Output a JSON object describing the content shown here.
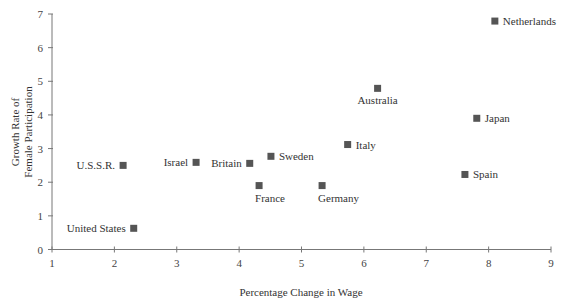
{
  "chart_data": {
    "type": "scatter",
    "title": "",
    "xlabel": "Percentage Change in Wage",
    "ylabel": [
      "Growth Rate of",
      "Female Participation"
    ],
    "xlim": [
      1,
      9
    ],
    "ylim": [
      0,
      7
    ],
    "xticks": [
      1,
      2,
      3,
      4,
      5,
      6,
      7,
      8,
      9
    ],
    "yticks": [
      0,
      1,
      2,
      3,
      4,
      5,
      6,
      7
    ],
    "grid": false,
    "legend": null,
    "marker_color": "#555555",
    "points": [
      {
        "label": "United States",
        "x": 2.31,
        "y": 0.63,
        "label_pos": "left"
      },
      {
        "label": "U.S.S.R.",
        "x": 2.14,
        "y": 2.5,
        "label_pos": "left"
      },
      {
        "label": "Israel",
        "x": 3.31,
        "y": 2.59,
        "label_pos": "left"
      },
      {
        "label": "Britain",
        "x": 4.17,
        "y": 2.56,
        "label_pos": "left"
      },
      {
        "label": "Sweden",
        "x": 4.51,
        "y": 2.77,
        "label_pos": "right"
      },
      {
        "label": "France",
        "x": 4.32,
        "y": 1.9,
        "label_pos": "below"
      },
      {
        "label": "Germany",
        "x": 5.33,
        "y": 1.9,
        "label_pos": "below"
      },
      {
        "label": "Italy",
        "x": 5.74,
        "y": 3.12,
        "label_pos": "right"
      },
      {
        "label": "Australia",
        "x": 6.22,
        "y": 4.79,
        "label_pos": "below"
      },
      {
        "label": "Japan",
        "x": 7.81,
        "y": 3.9,
        "label_pos": "right"
      },
      {
        "label": "Spain",
        "x": 7.62,
        "y": 2.23,
        "label_pos": "right"
      },
      {
        "label": "Netherlands",
        "x": 8.1,
        "y": 6.79,
        "label_pos": "right"
      }
    ]
  }
}
